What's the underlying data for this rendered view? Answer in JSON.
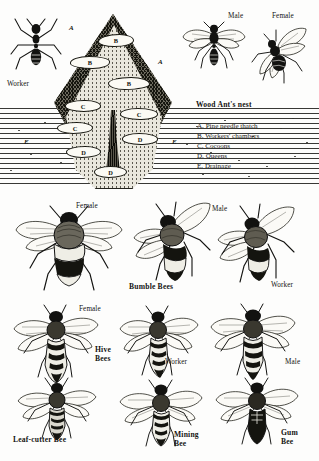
{
  "plate": {
    "title_caption": "Wood Ant's nest",
    "background_color": "#fdfdfc",
    "ink_color": "#121210"
  },
  "ant_section": {
    "worker_label": "Worker",
    "male_label": "Male",
    "female_label": "Female",
    "nest_caption": "Wood Ant's nest",
    "nest_labels": {
      "a1": "A",
      "a2": "A",
      "b1": "B",
      "b2": "B",
      "b3": "B",
      "c1": "C",
      "c2": "C",
      "c3": "C",
      "d1": "D",
      "d2": "D",
      "d3": "D",
      "e1": "E",
      "e2": "E"
    },
    "legend": [
      "A. Pine needle thatch",
      "B. Workers' chambers",
      "C. Cocoons",
      "D. Queens",
      "E. Drainage"
    ]
  },
  "bumble_bees": {
    "caption": "Bumble Bees",
    "female_label": "Female",
    "male_label": "Male",
    "worker_label": "Worker"
  },
  "hive_bees": {
    "caption": "Hive\nBees",
    "female_label": "Female",
    "worker_label": "Worker",
    "male_label": "Male"
  },
  "solitary_bees": {
    "leaf_cutter_label": "Leaf-cutter Bee",
    "mining_label": "Mining\nBee",
    "gum_label": "Gum\nBee"
  }
}
